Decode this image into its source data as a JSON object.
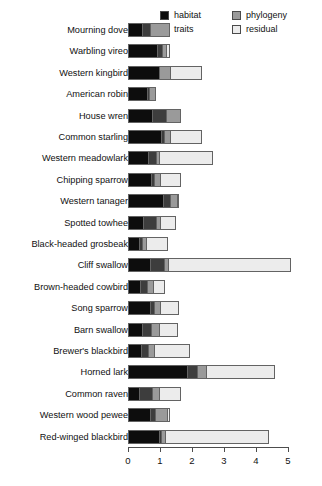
{
  "chart_data": {
    "type": "bar",
    "orientation": "horizontal",
    "stacked": true,
    "title": "",
    "xlabel": "",
    "ylabel": "",
    "xlim": [
      0,
      5
    ],
    "xticks": [
      0,
      1,
      2,
      3,
      4,
      5
    ],
    "xtick_labels": [
      "0",
      "1",
      "2",
      "3",
      "4",
      "5"
    ],
    "grid": false,
    "legend_position": "top-right",
    "series": [
      {
        "name": "habitat",
        "color": "#0d0d0d"
      },
      {
        "name": "traits",
        "color": "#3d3d3d"
      },
      {
        "name": "phylogeny",
        "color": "#9a9a9a"
      },
      {
        "name": "residual",
        "color": "#ececec"
      }
    ],
    "categories": [
      "Mourning dove",
      "Warbling vireo",
      "Western kingbird",
      "American robin",
      "House wren",
      "Common starling",
      "Western meadowlark",
      "Chipping sparrow",
      "Western tanager",
      "Spotted towhee",
      "Black-headed grosbeak",
      "Cliff swallow",
      "Brown-headed cowbird",
      "Song sparrow",
      "Barn swallow",
      "Brewer's blackbird",
      "Horned lark",
      "Common raven",
      "Western wood pewee",
      "Red-winged blackbird"
    ],
    "values": {
      "habitat": [
        0.42,
        0.92,
        0.97,
        0.62,
        0.75,
        1.02,
        0.62,
        0.72,
        1.1,
        0.45,
        0.32,
        0.65,
        0.38,
        0.68,
        0.42,
        0.4,
        1.85,
        0.32,
        0.7,
        0.95
      ],
      "traits": [
        0.27,
        0.15,
        0.0,
        0.05,
        0.45,
        0.1,
        0.23,
        0.1,
        0.22,
        0.42,
        0.1,
        0.45,
        0.22,
        0.12,
        0.3,
        0.22,
        0.3,
        0.42,
        0.15,
        0.08
      ],
      "phylogeny": [
        0.62,
        0.15,
        0.35,
        0.2,
        0.45,
        0.2,
        0.1,
        0.2,
        0.25,
        0.15,
        0.15,
        0.15,
        0.2,
        0.22,
        0.25,
        0.2,
        0.3,
        0.22,
        0.4,
        0.12
      ],
      "residual": [
        0.0,
        0.1,
        1.0,
        0.0,
        0.0,
        0.98,
        1.7,
        0.63,
        0.03,
        0.48,
        0.68,
        3.85,
        0.35,
        0.58,
        0.58,
        1.13,
        2.15,
        0.69,
        0.05,
        3.25
      ]
    },
    "totals": [
      1.31,
      1.32,
      2.32,
      0.87,
      1.65,
      2.3,
      2.65,
      1.65,
      1.6,
      1.5,
      1.25,
      5.1,
      1.15,
      1.6,
      1.55,
      1.95,
      4.6,
      1.65,
      1.3,
      4.4
    ]
  },
  "legend": {
    "column_1": [
      {
        "label": "habitat",
        "color": "#0d0d0d"
      },
      {
        "label": "traits",
        "color": "#3d3d3d"
      }
    ],
    "column_2": [
      {
        "label": "phylogeny",
        "color": "#9a9a9a"
      },
      {
        "label": "residual",
        "color": "#ececec"
      }
    ]
  }
}
